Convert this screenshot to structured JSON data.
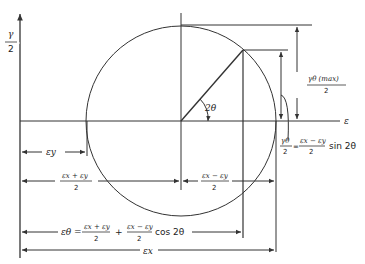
{
  "axes": {
    "vertical_label_num": "γ",
    "vertical_label_den": "2",
    "horizontal_label": "ε"
  },
  "angle_label": "2θ",
  "dimensions": {
    "gamma_max_num": "γθ (max)",
    "gamma_max_den": "2",
    "gamma_theta_num": "γθ",
    "gamma_theta_den": "2",
    "gamma_theta_eq": "=",
    "gamma_theta_rhs_num": "εx − εy",
    "gamma_theta_rhs_den": "2",
    "gamma_theta_trig": "sin 2θ",
    "eps_y": "εy",
    "avg_num": "εx + εy",
    "avg_den": "2",
    "diff_num": "εx − εy",
    "diff_den": "2",
    "eps_theta_lhs": "εθ =",
    "eps_theta_t1_num": "εx + εy",
    "eps_theta_t1_den": "2",
    "eps_theta_plus": "+",
    "eps_theta_t2_num": "εx − εy",
    "eps_theta_t2_den": "2",
    "eps_theta_trig": "cos 2θ",
    "eps_x": "εx"
  },
  "colors": {
    "line": "#333333",
    "background": "#ffffff"
  }
}
